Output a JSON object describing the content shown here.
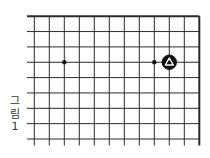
{
  "figure": {
    "caption_chars": [
      "그",
      "림",
      "1"
    ],
    "caption": "그림 1"
  },
  "board": {
    "type": "go-board-fragment",
    "board_size": 19,
    "visible_region": "top-right corner",
    "visible_columns": 12,
    "visible_rows": 9,
    "closed_edges": [
      "top",
      "right"
    ],
    "open_edges": [
      "left",
      "bottom"
    ],
    "line_color": "#2a2a2a",
    "star_points": [
      {
        "col": 2,
        "row": 3
      },
      {
        "col": 8,
        "row": 3
      }
    ],
    "stones": [
      {
        "col": 9,
        "row": 3,
        "color": "black",
        "marker": "triangle"
      }
    ]
  }
}
